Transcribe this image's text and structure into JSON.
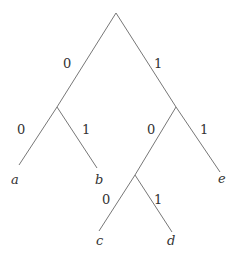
{
  "diagram": {
    "type": "binary-tree",
    "edge_labels": {
      "root_left": "0",
      "root_right": "1",
      "left_left": "0",
      "left_right": "1",
      "right_left": "0",
      "right_right": "1",
      "rl_left": "0",
      "rl_right": "1"
    },
    "leaves": {
      "a": "a",
      "b": "b",
      "c": "c",
      "d": "d",
      "e": "e"
    },
    "line_color": "#777777"
  }
}
